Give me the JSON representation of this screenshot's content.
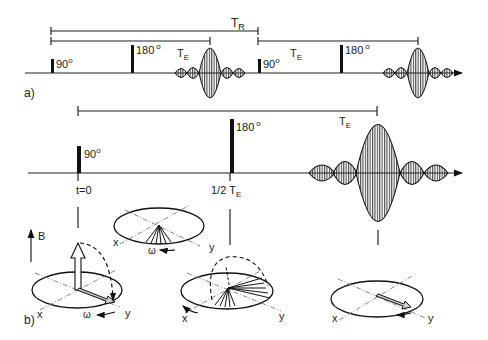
{
  "part_a": {
    "label": "a)",
    "tr_label": "T",
    "tr_sub": "R",
    "te_label": "T",
    "te_sub": "E",
    "pulse_90": "90",
    "pulse_180": "180",
    "degree": "o"
  },
  "part_timeline": {
    "pulse_90": "90",
    "pulse_180": "180",
    "degree": "o",
    "te_label": "T",
    "te_sub": "E",
    "t0_label": "t=0",
    "half_te_label": "1/2 T",
    "half_te_sub": "E"
  },
  "part_b": {
    "label": "b)",
    "b_field_label": "B",
    "x_label": "x",
    "y_label": "y",
    "omega_label": "ω"
  },
  "colors": {
    "ink": "#111111",
    "dashdot": "#666666",
    "background": "#ffffff"
  }
}
